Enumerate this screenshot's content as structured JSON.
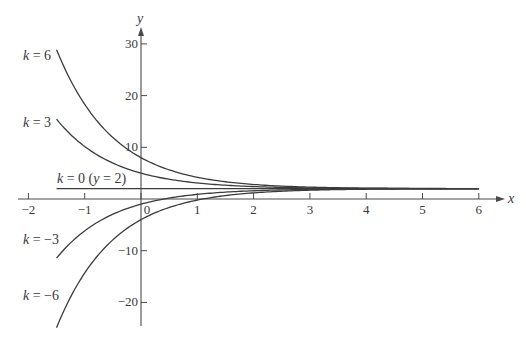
{
  "chart_data": {
    "type": "line",
    "title": "",
    "function": "y = 2 + k e^(-x)",
    "xlabel": "x",
    "ylabel": "y",
    "xlim": [
      -2,
      6
    ],
    "ylim": [
      -25,
      30
    ],
    "x_domain_curves": [
      -1.5,
      6
    ],
    "grid": false,
    "legend": "inline labels at left end of each curve",
    "x_ticks": [
      -2,
      -1,
      0,
      1,
      2,
      3,
      4,
      5,
      6
    ],
    "x_tick_labels": [
      "−2",
      "−1",
      "0",
      "1",
      "2",
      "3",
      "4",
      "5",
      "6"
    ],
    "y_ticks": [
      30,
      20,
      10,
      -10,
      -20
    ],
    "y_tick_labels": [
      "30",
      "20",
      "10",
      "−10",
      "−20"
    ],
    "series": [
      {
        "name": "k = 6",
        "k": 6,
        "x": [
          -1.5,
          -1,
          0,
          1,
          2,
          3,
          4,
          5,
          6
        ],
        "values": [
          28.89,
          18.31,
          8.0,
          4.21,
          2.81,
          2.3,
          2.11,
          2.04,
          2.01
        ]
      },
      {
        "name": "k = 3",
        "k": 3,
        "x": [
          -1.5,
          -1,
          0,
          1,
          2,
          3,
          4,
          5,
          6
        ],
        "values": [
          15.45,
          10.15,
          5.0,
          3.1,
          2.41,
          2.15,
          2.05,
          2.02,
          2.01
        ]
      },
      {
        "name": "k = 0 (y = 2)",
        "k": 0,
        "x": [
          -1.5,
          -1,
          0,
          1,
          2,
          3,
          4,
          5,
          6
        ],
        "values": [
          2,
          2,
          2,
          2,
          2,
          2,
          2,
          2,
          2
        ]
      },
      {
        "name": "k = −3",
        "k": -3,
        "x": [
          -1.5,
          -1,
          0,
          1,
          2,
          3,
          4,
          5,
          6
        ],
        "values": [
          -11.45,
          -6.15,
          -1.0,
          0.9,
          1.59,
          1.85,
          1.95,
          1.98,
          1.99
        ]
      },
      {
        "name": "k = −6",
        "k": -6,
        "x": [
          -1.5,
          -1,
          0,
          1,
          2,
          3,
          4,
          5,
          6
        ],
        "values": [
          -24.89,
          -14.31,
          -4.0,
          -0.21,
          1.19,
          1.7,
          1.89,
          1.96,
          1.99
        ]
      }
    ]
  },
  "labels": {
    "x_axis": "x",
    "y_axis": "y",
    "curves": [
      {
        "k_text": "k",
        "eq": " = 6",
        "extra": ""
      },
      {
        "k_text": "k",
        "eq": " = 3",
        "extra": ""
      },
      {
        "k_text": "k",
        "eq": " = 0 (",
        "extra": "y",
        "extra2": " = 2)"
      },
      {
        "k_text": "k",
        "eq": " = −3",
        "extra": ""
      },
      {
        "k_text": "k",
        "eq": " = −6",
        "extra": ""
      }
    ]
  }
}
